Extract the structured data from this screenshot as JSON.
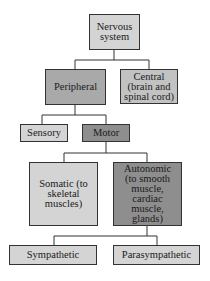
{
  "diagram": {
    "colors": {
      "light": "#d9d9d9",
      "medium": "#b3b3b3",
      "dark": "#8c8c8c",
      "border": "#333333"
    },
    "nodes": {
      "nervous_system": {
        "label": "Nervous system"
      },
      "peripheral": {
        "label": "Peripheral"
      },
      "central": {
        "label": "Central (brain and spinal cord)"
      },
      "sensory": {
        "label": "Sensory"
      },
      "motor": {
        "label": "Motor"
      },
      "somatic": {
        "label": "Somatic (to skeletal muscles)"
      },
      "autonomic": {
        "label": "Autonomic (to smooth muscle, cardiac muscle, glands)"
      },
      "sympathetic": {
        "label": "Sympathetic"
      },
      "parasympathetic": {
        "label": "Parasympathetic"
      }
    },
    "edges": [
      [
        "nervous_system",
        "peripheral"
      ],
      [
        "nervous_system",
        "central"
      ],
      [
        "peripheral",
        "sensory"
      ],
      [
        "peripheral",
        "motor"
      ],
      [
        "motor",
        "somatic"
      ],
      [
        "motor",
        "autonomic"
      ],
      [
        "autonomic",
        "sympathetic"
      ],
      [
        "autonomic",
        "parasympathetic"
      ]
    ]
  }
}
